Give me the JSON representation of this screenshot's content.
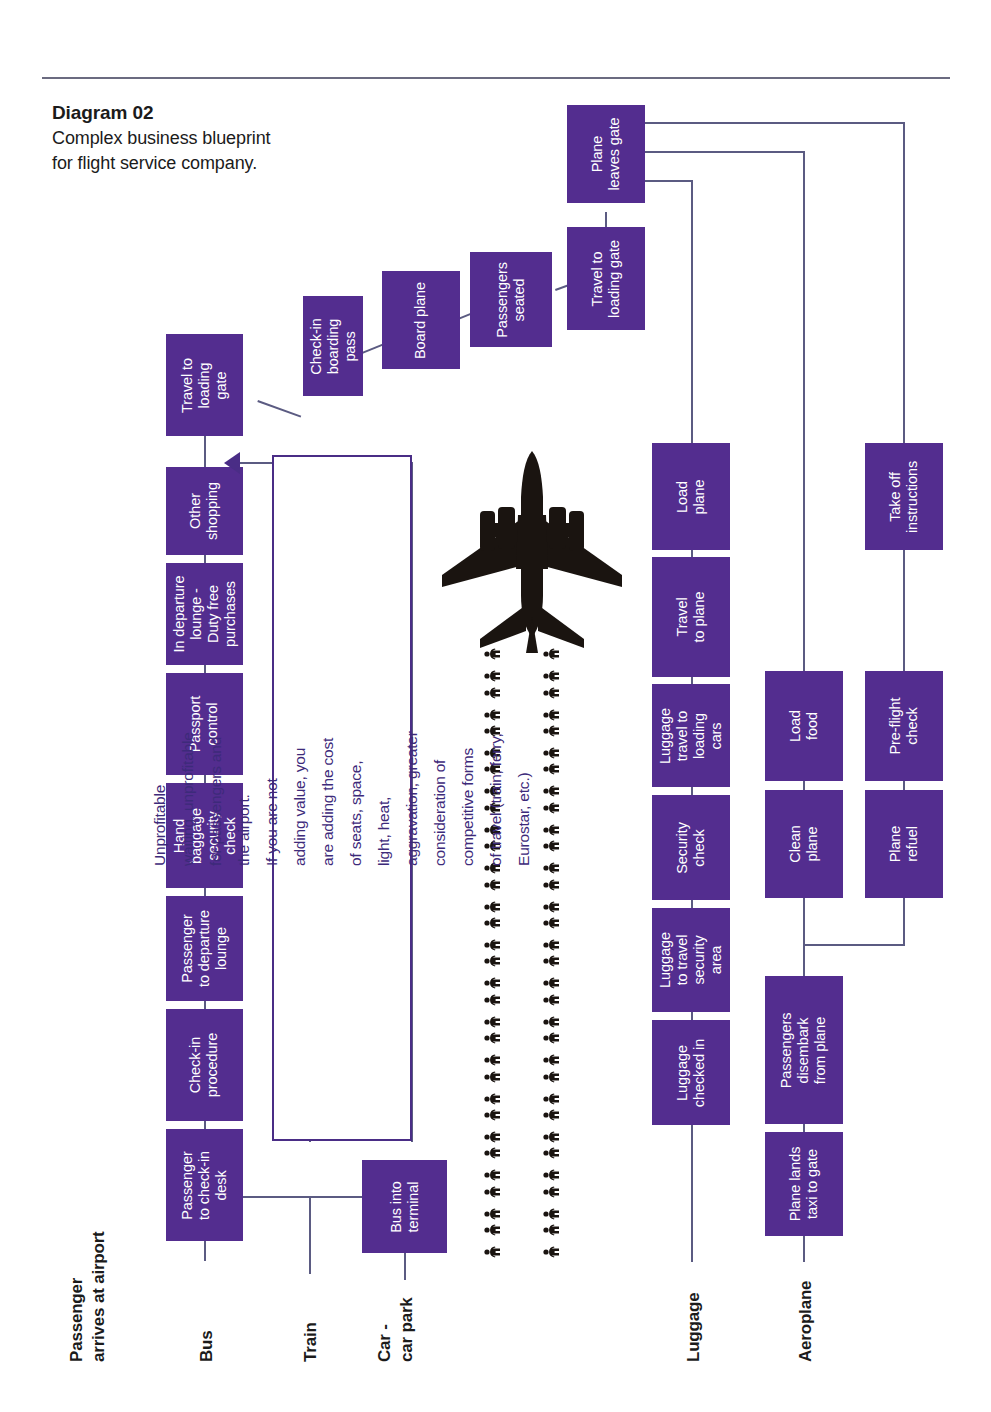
{
  "caption": {
    "title": "Diagram 02",
    "body": "Complex business\nblueprint for flight\nservice company."
  },
  "colors": {
    "node_fill": "#532d8f",
    "node_text": "#ffffff",
    "connector": "#5b5b82",
    "callout_border": "#4a2d86",
    "callout_text": "#3d2a7a",
    "lane_label": "#1b1b1b",
    "rule": "#6b6b80",
    "background": "#ffffff",
    "silhouette": "#1a1410"
  },
  "lanes": [
    {
      "id": "passenger-arrives",
      "label": "Passenger\narrives at airport"
    },
    {
      "id": "bus",
      "label": "Bus"
    },
    {
      "id": "train",
      "label": "Train"
    },
    {
      "id": "car-car-park",
      "label": "Car -\ncar park"
    },
    {
      "id": "luggage",
      "label": "Luggage"
    },
    {
      "id": "aeroplane",
      "label": "Aeroplane"
    }
  ],
  "callout": {
    "text": "Unprofitable waiting, unprofitable for passengers and the airport.\nIf you are not adding value, you are adding the cost of seats, space,\nlight, heat, aggravation, greater consideration of competitive forms\nof travel (train, ferry, Eurostar, etc.)"
  },
  "nodes": {
    "passenger_flow": [
      {
        "id": "passenger-to-check-in-desk",
        "label": "Passenger\nto check-in\ndesk"
      },
      {
        "id": "check-in-procedure",
        "label": "Check-in\nprocedure"
      },
      {
        "id": "passenger-to-departure-lounge",
        "label": "Passenger\nto departure\nlounge"
      },
      {
        "id": "hand-baggage-security-check",
        "label": "Hand\nbaggage\nsecurity\ncheck"
      },
      {
        "id": "passport-control",
        "label": "Passport\ncontrol"
      },
      {
        "id": "in-departure-lounge-duty-free",
        "label": "In departure\nlounge -\nDuty free\npurchases"
      },
      {
        "id": "other-shopping",
        "label": "Other\nshopping"
      },
      {
        "id": "travel-to-loading-gate-1",
        "label": "Travel to\nloading gate"
      }
    ],
    "boarding_flow": [
      {
        "id": "check-in-boarding-pass",
        "label": "Check-in\nboarding\npass"
      },
      {
        "id": "board-plane",
        "label": "Board plane"
      },
      {
        "id": "passengers-seated",
        "label": "Passengers\nseated"
      },
      {
        "id": "travel-to-loading-gate-2",
        "label": "Travel to\nloading gate"
      },
      {
        "id": "plane-leaves-gate",
        "label": "Plane\nleaves gate"
      }
    ],
    "luggage_flow": [
      {
        "id": "luggage-checked-in",
        "label": "Luggage\nchecked in"
      },
      {
        "id": "luggage-to-travel-security-area",
        "label": "Luggage\nto travel\nsecurity\narea"
      },
      {
        "id": "security-check",
        "label": "Security\ncheck"
      },
      {
        "id": "luggage-travel-to-loading-cars",
        "label": "Luggage\ntravel to\nloading\ncars"
      },
      {
        "id": "travel-to-plane",
        "label": "Travel\nto plane"
      },
      {
        "id": "load-plane",
        "label": "Load\nplane"
      }
    ],
    "aeroplane_flow": [
      {
        "id": "plane-lands-taxi-to-gate",
        "label": "Plane lands\ntaxi to gate"
      },
      {
        "id": "passengers-disembark-from-plane",
        "label": "Passengers\ndisembark\nfrom plane"
      },
      {
        "id": "clean-plane",
        "label": "Clean\nplane"
      },
      {
        "id": "load-food",
        "label": "Load\nfood"
      }
    ],
    "flight_prep_flow": [
      {
        "id": "plane-refuel",
        "label": "Plane\nrefuel"
      },
      {
        "id": "pre-flight-check",
        "label": "Pre-flight\ncheck"
      },
      {
        "id": "take-off-instructions",
        "label": "Take off\ninstructions"
      }
    ],
    "transport": [
      {
        "id": "bus-into-terminal",
        "label": "Bus into\nterminal"
      }
    ]
  },
  "illustration": {
    "aeroplane_icon": "airplane-top-view-silhouette",
    "people_icon": "person-silhouette",
    "people_rows": 16,
    "people_columns": 2,
    "people_per_cell": 2
  }
}
